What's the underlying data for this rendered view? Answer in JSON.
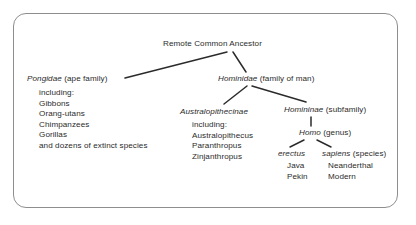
{
  "figure": {
    "type": "taxonomic-tree-diagram",
    "caption_visible": false,
    "frame": {
      "style": "rounded-rectangle",
      "color": "#8e8e8e"
    },
    "text_color": "#2b2b2b",
    "background": "#ffffff"
  },
  "tree": {
    "root": {
      "label": "Remote Common Ancestor",
      "italic": ""
    },
    "pongidae": {
      "italic": "Pongidae",
      "label": " (ape family)",
      "sublist_intro": "including:",
      "members": [
        "Gibbons",
        "Orang-utans",
        "Chimpanzees",
        "Gorillas",
        "and dozens of extinct species"
      ]
    },
    "hominidae": {
      "italic": "Hominidae",
      "label": " (family of man)"
    },
    "australopithecinae": {
      "italic": "Australopithecinae",
      "label": "",
      "sublist_intro": "including:",
      "members": [
        "Australopithecus",
        "Paranthropus",
        "Zinjanthropus"
      ]
    },
    "homininae": {
      "italic": "Homininae",
      "label": " (subfamily)"
    },
    "homo": {
      "italic": "Homo",
      "label": " (genus)"
    },
    "erectus": {
      "italic": "erectus",
      "label": "",
      "members": [
        "Java",
        "Pekin"
      ]
    },
    "sapiens": {
      "italic": "sapiens",
      "label": " (species)",
      "members": [
        "Neanderthal",
        "Modern"
      ]
    }
  },
  "connectors": [
    {
      "name": "root-to-pongidae",
      "from": "Remote Common Ancestor",
      "to": "Pongidae"
    },
    {
      "name": "root-to-hominidae",
      "from": "Remote Common Ancestor",
      "to": "Hominidae"
    },
    {
      "name": "hominidae-to-australo",
      "from": "Hominidae",
      "to": "Australopithecinae"
    },
    {
      "name": "hominidae-to-homininae",
      "from": "Hominidae",
      "to": "Homininae"
    },
    {
      "name": "homininae-to-homo",
      "from": "Homininae",
      "to": "Homo"
    },
    {
      "name": "homo-to-erectus",
      "from": "Homo",
      "to": "erectus"
    },
    {
      "name": "homo-to-sapiens",
      "from": "Homo",
      "to": "sapiens"
    }
  ]
}
